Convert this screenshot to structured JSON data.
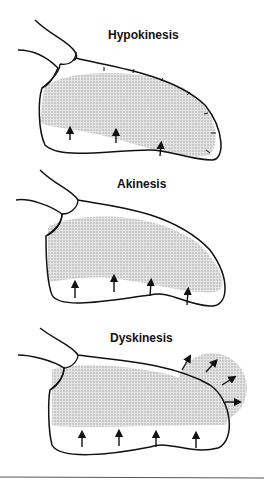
{
  "panels": [
    {
      "label": "Hypokinesis"
    },
    {
      "label": "Akinesis"
    },
    {
      "label": "Dyskinesis"
    }
  ]
}
